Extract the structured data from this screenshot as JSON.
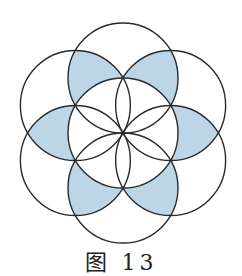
{
  "figure": {
    "center": [
      123,
      133
    ],
    "radius": 55,
    "outer_circle_angles_deg": [
      90,
      30,
      -30,
      -90,
      -150,
      150
    ],
    "shaded_count": 6,
    "colors": {
      "stroke": "#2a2a2a",
      "fill": "#bcd6e8",
      "background": "#ffffff"
    }
  },
  "caption": "图 13"
}
